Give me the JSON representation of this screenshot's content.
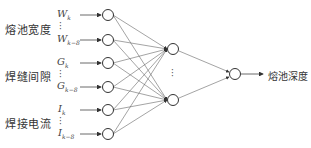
{
  "groups": [
    {
      "label": "熔池宽度",
      "var_first": "W",
      "sub_first": "k",
      "var_last": "W",
      "sub_last": "k−8"
    },
    {
      "label": "焊缝间隙",
      "var_first": "G",
      "sub_first": "k",
      "var_last": "G",
      "sub_last": "k−8"
    },
    {
      "label": "焊接电流",
      "var_first": "I",
      "sub_first": "k",
      "var_last": "I",
      "sub_last": "k−8"
    }
  ],
  "output_label": "熔池深度",
  "hidden_ellipsis": "⋮",
  "colors": {
    "line": "#555555",
    "node": "#333333"
  }
}
